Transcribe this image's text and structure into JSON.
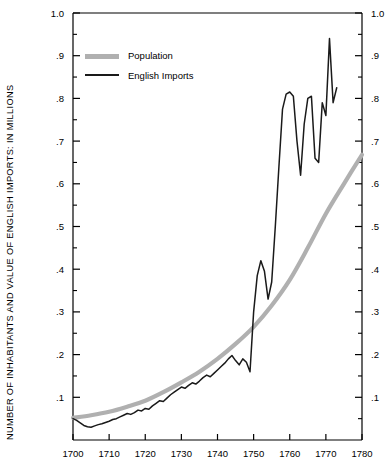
{
  "chart_data": {
    "type": "line",
    "title": "",
    "xlabel": "",
    "ylabel": "NUMBER OF INHABITANTS AND VALUE OF ENGLISH IMPORTS: IN MILLIONS",
    "xlim": [
      1700,
      1780
    ],
    "ylim": [
      0,
      1.0
    ],
    "grid": false,
    "legend_position": "top-left",
    "x_ticks": [
      1700,
      1710,
      1720,
      1730,
      1740,
      1750,
      1760,
      1770,
      1780
    ],
    "x_tick_labels": [
      "1700",
      "1710",
      "1720",
      "1730",
      "1740",
      "1750",
      "1760",
      "1770",
      "1780"
    ],
    "y_ticks": [
      0.1,
      0.2,
      0.3,
      0.4,
      0.5,
      0.6,
      0.7,
      0.8,
      0.9,
      1.0
    ],
    "y_tick_labels": [
      ".1",
      ".2",
      ".3",
      ".4",
      ".5",
      ".6",
      ".7",
      ".8",
      ".9",
      "1.0"
    ],
    "y_minor_ticks": [
      0.05,
      0.15,
      0.25,
      0.35,
      0.45,
      0.55,
      0.65,
      0.75,
      0.85,
      0.95
    ],
    "right_axis_mirrored": true,
    "series": [
      {
        "name": "Population",
        "color": "#b0b0b0",
        "line_width": 4.2,
        "style": "smooth-thick",
        "x": [
          1700,
          1705,
          1710,
          1715,
          1720,
          1725,
          1730,
          1735,
          1740,
          1745,
          1750,
          1755,
          1760,
          1765,
          1770,
          1775,
          1780
        ],
        "values": [
          0.052,
          0.058,
          0.066,
          0.078,
          0.092,
          0.112,
          0.135,
          0.16,
          0.19,
          0.225,
          0.265,
          0.315,
          0.375,
          0.45,
          0.53,
          0.6,
          0.668
        ]
      },
      {
        "name": "English Imports",
        "color": "#1a1a1a",
        "line_width": 1.5,
        "style": "jagged-thin",
        "x": [
          1700,
          1701,
          1702,
          1703,
          1704,
          1705,
          1706,
          1707,
          1708,
          1709,
          1710,
          1711,
          1712,
          1713,
          1714,
          1715,
          1716,
          1717,
          1718,
          1719,
          1720,
          1721,
          1722,
          1723,
          1724,
          1725,
          1726,
          1727,
          1728,
          1729,
          1730,
          1731,
          1732,
          1733,
          1734,
          1735,
          1736,
          1737,
          1738,
          1739,
          1740,
          1741,
          1742,
          1743,
          1744,
          1745,
          1746,
          1747,
          1748,
          1749,
          1750,
          1751,
          1752,
          1753,
          1754,
          1755,
          1756,
          1757,
          1758,
          1759,
          1760,
          1761,
          1762,
          1763,
          1764,
          1765,
          1766,
          1767,
          1768,
          1769,
          1770,
          1771,
          1772,
          1773
        ],
        "values": [
          0.05,
          0.046,
          0.04,
          0.034,
          0.031,
          0.03,
          0.033,
          0.036,
          0.038,
          0.041,
          0.044,
          0.048,
          0.05,
          0.054,
          0.058,
          0.062,
          0.06,
          0.064,
          0.07,
          0.068,
          0.074,
          0.072,
          0.08,
          0.086,
          0.092,
          0.09,
          0.098,
          0.106,
          0.112,
          0.118,
          0.124,
          0.121,
          0.128,
          0.134,
          0.131,
          0.138,
          0.146,
          0.152,
          0.148,
          0.156,
          0.164,
          0.172,
          0.18,
          0.19,
          0.198,
          0.186,
          0.176,
          0.19,
          0.182,
          0.16,
          0.3,
          0.385,
          0.42,
          0.395,
          0.33,
          0.37,
          0.5,
          0.64,
          0.775,
          0.81,
          0.815,
          0.805,
          0.7,
          0.62,
          0.74,
          0.8,
          0.805,
          0.66,
          0.65,
          0.79,
          0.76,
          0.94,
          0.79,
          0.825
        ]
      }
    ]
  },
  "legend": {
    "items": [
      {
        "label": "Population"
      },
      {
        "label": "English Imports"
      }
    ]
  },
  "axes": {
    "y_title": "NUMBER OF INHABITANTS AND VALUE OF ENGLISH IMPORTS: IN MILLIONS"
  }
}
